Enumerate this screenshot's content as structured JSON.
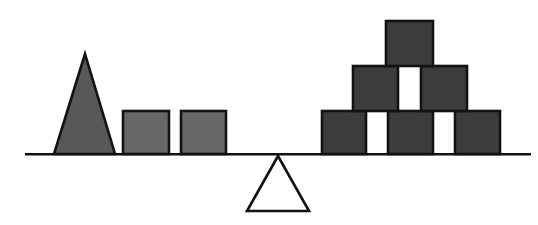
{
  "canvas": {
    "width": 538,
    "height": 225,
    "background_color": "#ffffff",
    "outline_color": "#121212",
    "stroke_width": 2.6
  },
  "colors": {
    "left_triangle_fill": "#585858",
    "left_block_fill": "#676767",
    "right_block_fill": "#3c3c3c",
    "fulcrum_fill": "#ffffff"
  },
  "beam": {
    "name": "balance-beam",
    "x1": 25,
    "y1": 154.3,
    "x2": 531,
    "y2": 154.3
  },
  "fulcrum": {
    "name": "fulcrum-triangle",
    "points": [
      [
        278,
        156
      ],
      [
        247,
        211
      ],
      [
        309,
        211
      ]
    ],
    "fill": "#ffffff"
  },
  "left_side": {
    "shapes": [
      {
        "name": "left-weight-triangle",
        "type": "polygon",
        "points": [
          [
            85,
            54
          ],
          [
            54,
            154
          ],
          [
            115,
            154
          ]
        ],
        "fill": "#585858"
      },
      {
        "name": "left-weight-block-1",
        "type": "rect",
        "x": 123,
        "y": 111,
        "w": 46,
        "h": 43,
        "fill": "#676767"
      },
      {
        "name": "left-weight-block-2",
        "type": "rect",
        "x": 181,
        "y": 111,
        "w": 45,
        "h": 43,
        "fill": "#676767"
      }
    ]
  },
  "right_side": {
    "shapes": [
      {
        "name": "right-block-bottom-1",
        "type": "rect",
        "x": 322,
        "y": 111,
        "w": 44,
        "h": 43,
        "fill": "#3c3c3c"
      },
      {
        "name": "right-block-bottom-2",
        "type": "rect",
        "x": 388,
        "y": 111,
        "w": 45,
        "h": 43,
        "fill": "#3c3c3c"
      },
      {
        "name": "right-block-bottom-3",
        "type": "rect",
        "x": 455,
        "y": 111,
        "w": 45,
        "h": 43,
        "fill": "#3c3c3c"
      },
      {
        "name": "right-block-middle-1",
        "type": "rect",
        "x": 353,
        "y": 66,
        "w": 45,
        "h": 45,
        "fill": "#3c3c3c"
      },
      {
        "name": "right-block-middle-2",
        "type": "rect",
        "x": 421,
        "y": 66,
        "w": 46,
        "h": 45,
        "fill": "#3c3c3c"
      },
      {
        "name": "right-block-top",
        "type": "rect",
        "x": 386,
        "y": 21,
        "w": 47,
        "h": 45,
        "fill": "#3c3c3c"
      }
    ]
  }
}
